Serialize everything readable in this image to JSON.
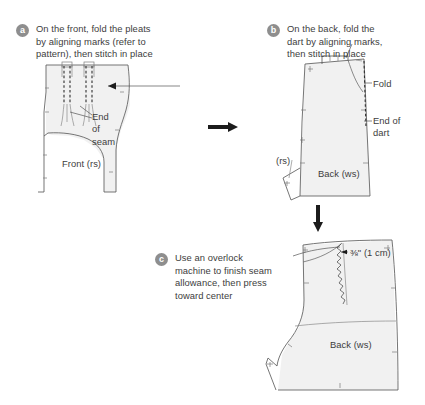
{
  "figure": {
    "background_color": "#ffffff",
    "piece_fill_color": "#f1f1f1",
    "outline_color": "#5d5d5d",
    "marker_color": "#8e8e8e",
    "text_color": "#3d3d3d"
  },
  "steps": [
    {
      "marker": "a",
      "text": "On the front, fold the pleats\nby aligning marks (refer to\npattern), then stitch in place"
    },
    {
      "marker": "b",
      "text": "On the back, fold the\ndart by aligning marks,\nthen stitch in place"
    },
    {
      "marker": "c",
      "text": "Use an overlock\nmachine to finish seam\nallowance, then press\ntoward center"
    }
  ],
  "annotations": {
    "stitch_close_to_fold": "Stitch close\nto fold",
    "end_of_seam": "End\nof\nseam",
    "fold": "Fold",
    "end_of_dart": "End of\ndart",
    "rs_back": "(rs)",
    "back_ws_b": "Back (ws)",
    "front_rs": "Front (rs)",
    "seam_allowance": "⅜\" (1 cm)",
    "back_ws_c": "Back (ws)"
  },
  "flow": {
    "arrow_a_to_b": "right-arrow",
    "arrow_b_to_c": "down-arrow"
  }
}
